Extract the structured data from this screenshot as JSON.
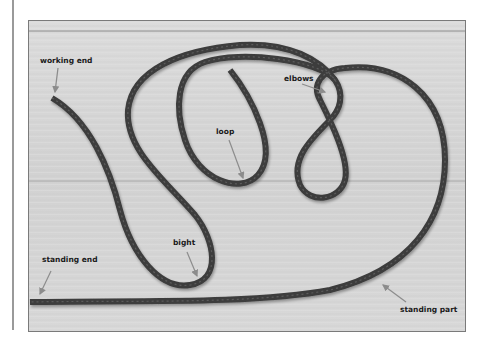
{
  "figure": {
    "labels": [
      {
        "id": "working-end",
        "text": "working end"
      },
      {
        "id": "loop",
        "text": "loop"
      },
      {
        "id": "elbows",
        "text": "elbows"
      },
      {
        "id": "bight",
        "text": "bight"
      },
      {
        "id": "standing-end",
        "text": "standing end"
      },
      {
        "id": "standing-part",
        "text": "standing part"
      }
    ],
    "colors": {
      "wood": "#d6d6d6",
      "wood_dark": "#c2c2c2",
      "rope": "#3c3c3c",
      "rope_highlight": "#5a5a5a",
      "arrow": "#8c8c8c",
      "frame": "#7a7a7a"
    }
  }
}
